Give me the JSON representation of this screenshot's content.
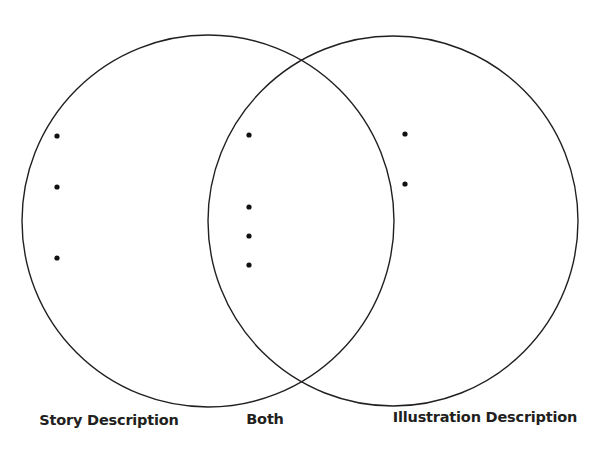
{
  "diagram": {
    "type": "venn",
    "stroke_color": "#231f20",
    "dot_color": "#111111",
    "circles": [
      {
        "name": "story",
        "cx": 208,
        "cy": 221,
        "r": 186
      },
      {
        "name": "illustration",
        "cx": 393,
        "cy": 221,
        "r": 185
      }
    ],
    "regions": [
      {
        "name": "story-only",
        "label": "Story Description",
        "label_x": 109,
        "label_y": 421,
        "bullets": [
          {
            "x": 57,
            "y": 136,
            "text": ""
          },
          {
            "x": 57,
            "y": 187,
            "text": ""
          },
          {
            "x": 57,
            "y": 258,
            "text": ""
          }
        ]
      },
      {
        "name": "both",
        "label": "Both",
        "label_x": 265,
        "label_y": 420,
        "bullets": [
          {
            "x": 249,
            "y": 135,
            "text": ""
          },
          {
            "x": 249,
            "y": 207,
            "text": ""
          },
          {
            "x": 249,
            "y": 236,
            "text": ""
          },
          {
            "x": 249,
            "y": 265,
            "text": ""
          }
        ]
      },
      {
        "name": "illustration-only",
        "label": "Illustration Description",
        "label_x": 485,
        "label_y": 418,
        "bullets": [
          {
            "x": 405,
            "y": 134,
            "text": ""
          },
          {
            "x": 405,
            "y": 184,
            "text": ""
          }
        ]
      }
    ]
  }
}
